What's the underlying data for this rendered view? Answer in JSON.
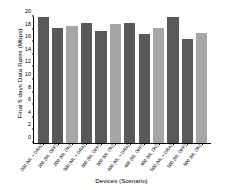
{
  "chart_data": {
    "type": "bar",
    "title": "",
    "xlabel": "Devices (Scenario)",
    "ylabel": "Final 5 days Data Rates (Mbps)",
    "ylim": [
      0,
      20
    ],
    "yticks": [
      0,
      2,
      4,
      6,
      8,
      10,
      12,
      14,
      16,
      18,
      20
    ],
    "ytick_labels": [
      "0",
      "2",
      "4",
      "6",
      "8",
      "10",
      "12",
      "14",
      "16",
      "18",
      "20"
    ],
    "grid": false,
    "legend_position": "none",
    "categories": [
      "200 (ML + DRA)",
      "200 (ML OFF)",
      "200 (ML ON)",
      "300 (ML + DRA)",
      "300 (ML OFF)",
      "300 (ML ON)",
      "400 (ML + DRA)",
      "400 (ML OFF)",
      "400 (ML ON)",
      "500 (ML + DRA)",
      "500 (ML OFF)",
      "500 (ML ON)"
    ],
    "values": [
      20.0,
      18.3,
      18.6,
      19.1,
      17.8,
      18.9,
      19.1,
      17.3,
      18.3,
      20.0,
      16.5,
      17.5
    ],
    "bar_shades": [
      "dark",
      "dark",
      "light",
      "dark",
      "dark",
      "light",
      "dark",
      "dark",
      "light",
      "dark",
      "dark",
      "light"
    ],
    "colors": {
      "dark_bar": "#595959",
      "light_bar": "#a6a6a6",
      "axis": "#000000",
      "background": "#ffffff"
    }
  }
}
